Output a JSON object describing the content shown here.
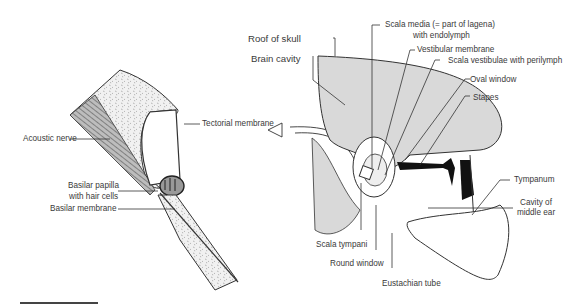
{
  "diagram": {
    "left_panel": {
      "labels": {
        "tectorial_membrane": "Tectorial membrane",
        "acoustic_nerve": "Acoustic nerve",
        "basilar_papilla_1": "Basilar papilla",
        "basilar_papilla_2": "with hair cells",
        "basilar_membrane": "Basilar membrane"
      }
    },
    "right_panel": {
      "labels": {
        "roof_of_skull": "Roof of skull",
        "brain_cavity": "Brain cavity",
        "scala_media_1": "Scala media (= part of lagena)",
        "scala_media_2": "with endolymph",
        "vestibular_membrane": "Vestibular membrane",
        "scala_vestibulae": "Scala vestibulae with perilymph",
        "oval_window": "Oval window",
        "stapes": "Stapes",
        "tympanum": "Tympanum",
        "cavity_middle_ear_1": "Cavity of",
        "cavity_middle_ear_2": "middle ear",
        "scala_tympani": "Scala tympani",
        "round_window": "Round window",
        "eustachian_tube": "Eustachian tube"
      }
    },
    "colors": {
      "bone_fill": "#d9d9d9",
      "stroke": "#333333",
      "stapes": "#111111",
      "stipple": "#8a8a8a"
    }
  }
}
